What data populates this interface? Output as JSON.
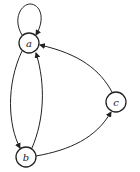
{
  "diagram": {
    "type": "directed-graph",
    "nodes": [
      {
        "id": "a",
        "label": "a"
      },
      {
        "id": "b",
        "label": "b"
      },
      {
        "id": "c",
        "label": "c"
      }
    ],
    "edges": [
      {
        "from": "a",
        "to": "a",
        "kind": "self-loop"
      },
      {
        "from": "a",
        "to": "b"
      },
      {
        "from": "b",
        "to": "a"
      },
      {
        "from": "b",
        "to": "c"
      },
      {
        "from": "c",
        "to": "a"
      }
    ],
    "colors": {
      "stroke": "#222222",
      "background": "#ffffff"
    }
  }
}
